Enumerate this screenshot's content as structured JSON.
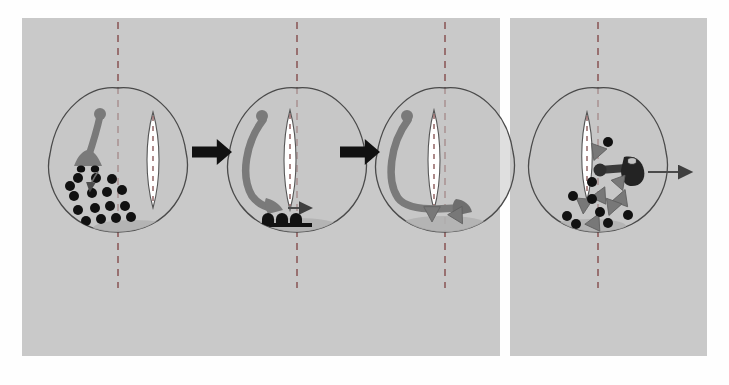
{
  "figure": {
    "background_color": "#ffffff",
    "panel_color": "#c9c9c9",
    "panel_left": {
      "label": "left-panel",
      "x": 22,
      "y": 18,
      "width": 478,
      "height": 338
    },
    "panel_right": {
      "label": "right-panel",
      "x": 510,
      "y": 18,
      "width": 197,
      "height": 338
    }
  },
  "colors": {
    "panel_bg": "#c9c9c9",
    "cell_fill": "#c4c4c4",
    "cell_outline": "#4a4a4a",
    "nucleus_fill": "#ffffff",
    "nucleus_outline": "#555555",
    "axis_dash": "#8c5a5a",
    "organelle": "#7a7a7a",
    "granule": "#111111",
    "triangle": "#787878",
    "shadow": "#b0b0b0",
    "block_arrow": "#111111",
    "thin_arrow": "#555555"
  },
  "stages": [
    {
      "id": "stage-1",
      "name": "cell-stage-1",
      "cx": 118,
      "cy": 170,
      "axis_dash": true,
      "spindle": {
        "present": true,
        "x": 145,
        "y": 112,
        "w": 16,
        "h": 96,
        "orientation": "vertical"
      },
      "stalk": {
        "present": true,
        "shape": "diagonal-stalk-with-knob",
        "description": "organelle stalk running from upper knob down-left to a flared foot"
      },
      "knob": {
        "present": true,
        "x": 100,
        "y": 114,
        "r": 6
      },
      "foot": {
        "present": true,
        "x": 88,
        "y": 160,
        "type": "flared-foot-with-two-dark-ovals"
      },
      "granules": [
        {
          "x": 78,
          "y": 178,
          "r": 5
        },
        {
          "x": 96,
          "y": 178,
          "r": 5
        },
        {
          "x": 112,
          "y": 179,
          "r": 5
        },
        {
          "x": 74,
          "y": 196,
          "r": 5
        },
        {
          "x": 92,
          "y": 193,
          "r": 5
        },
        {
          "x": 107,
          "y": 192,
          "r": 5
        },
        {
          "x": 122,
          "y": 190,
          "r": 5
        },
        {
          "x": 78,
          "y": 210,
          "r": 5
        },
        {
          "x": 95,
          "y": 208,
          "r": 5
        },
        {
          "x": 110,
          "y": 206,
          "r": 5
        },
        {
          "x": 125,
          "y": 206,
          "r": 5
        },
        {
          "x": 86,
          "y": 221,
          "r": 5
        },
        {
          "x": 101,
          "y": 219,
          "r": 5
        },
        {
          "x": 116,
          "y": 218,
          "r": 5
        },
        {
          "x": 131,
          "y": 217,
          "r": 5
        },
        {
          "x": 70,
          "y": 186,
          "r": 5
        }
      ],
      "triangles": [],
      "internal_arrow": {
        "present": true,
        "x1": 98,
        "y1": 172,
        "x2": 90,
        "y2": 190,
        "style": "thin-curved"
      },
      "shadow": {
        "present": true,
        "cx": 133,
        "cy": 228,
        "rx": 40,
        "ry": 8
      },
      "exit_arrow": {
        "present": false
      }
    },
    {
      "id": "stage-2",
      "name": "cell-stage-2",
      "cx": 297,
      "cy": 170,
      "axis_dash": true,
      "spindle": {
        "present": true,
        "x": 282,
        "y": 110,
        "w": 16,
        "h": 100,
        "orientation": "vertical"
      },
      "stalk": {
        "present": true,
        "shape": "hooked-stalk-to-base",
        "description": "organelle stalk curving from upper knob around left side to a flared foot at the cell base"
      },
      "knob": {
        "present": true,
        "x": 262,
        "y": 116,
        "r": 6
      },
      "foot": {
        "present": true,
        "x": 275,
        "y": 207,
        "type": "flared-foot"
      },
      "granules": [],
      "docked_granules": {
        "present": true,
        "count": 3,
        "x": 276,
        "y": 222,
        "description": "dark docked vesicles fused at the contact zone"
      },
      "triangles": [],
      "internal_arrow": {
        "present": true,
        "x1": 288,
        "y1": 208,
        "x2": 310,
        "y2": 208,
        "style": "straight-right"
      },
      "shadow": {
        "present": true,
        "cx": 296,
        "cy": 226,
        "rx": 42,
        "ry": 8
      },
      "exit_arrow": {
        "present": false
      }
    },
    {
      "id": "stage-3",
      "name": "cell-stage-3",
      "cx": 445,
      "cy": 170,
      "axis_dash": true,
      "spindle": {
        "present": true,
        "x": 426,
        "y": 110,
        "w": 16,
        "h": 100,
        "orientation": "vertical"
      },
      "stalk": {
        "present": true,
        "shape": "hooked-stalk-along-base",
        "description": "organelle stalk curving down the left side then running horizontally along the cell base to a flared head on the right"
      },
      "knob": {
        "present": true,
        "x": 407,
        "y": 116,
        "r": 6
      },
      "foot": {
        "present": true,
        "x": 462,
        "y": 205,
        "type": "flared-head-right"
      },
      "granules": [],
      "triangles": [
        {
          "x": 432,
          "y": 213,
          "rot": 180,
          "size": 9
        },
        {
          "x": 458,
          "y": 216,
          "rot": 150,
          "size": 9
        }
      ],
      "internal_arrow": {
        "present": false
      },
      "shadow": {
        "present": true,
        "cx": 444,
        "cy": 224,
        "rx": 42,
        "ry": 8
      },
      "exit_arrow": {
        "present": false
      }
    },
    {
      "id": "stage-4",
      "name": "cell-stage-4",
      "cx": 598,
      "cy": 170,
      "axis_dash": true,
      "spindle": {
        "present": true,
        "x": 580,
        "y": 112,
        "w": 14,
        "h": 88,
        "orientation": "vertical"
      },
      "stalk": {
        "present": true,
        "shape": "horizontal-stalk-right",
        "description": "organelle stalk lying horizontally pointing right toward the cell edge"
      },
      "knob": {
        "present": true,
        "x": 600,
        "y": 170,
        "r": 6
      },
      "foot": {
        "present": true,
        "x": 629,
        "y": 168,
        "type": "flared-head-right-with-pore"
      },
      "granules": [
        {
          "x": 608,
          "y": 142,
          "r": 5
        },
        {
          "x": 592,
          "y": 182,
          "r": 5
        },
        {
          "x": 573,
          "y": 196,
          "r": 5
        },
        {
          "x": 592,
          "y": 199,
          "r": 5
        },
        {
          "x": 600,
          "y": 212,
          "r": 5
        },
        {
          "x": 567,
          "y": 216,
          "r": 5
        },
        {
          "x": 576,
          "y": 224,
          "r": 5
        },
        {
          "x": 608,
          "y": 223,
          "r": 5
        },
        {
          "x": 628,
          "y": 215,
          "r": 5
        }
      ],
      "triangles": [
        {
          "x": 597,
          "y": 152,
          "rot": 200,
          "size": 9
        },
        {
          "x": 620,
          "y": 183,
          "rot": 160,
          "size": 8
        },
        {
          "x": 601,
          "y": 195,
          "rot": 25,
          "size": 9
        },
        {
          "x": 622,
          "y": 198,
          "rot": 20,
          "size": 9
        },
        {
          "x": 584,
          "y": 205,
          "rot": 185,
          "size": 9
        },
        {
          "x": 612,
          "y": 207,
          "rot": 200,
          "size": 9
        },
        {
          "x": 595,
          "y": 222,
          "rot": 25,
          "size": 9
        }
      ],
      "internal_arrow": {
        "present": false
      },
      "shadow": {
        "present": true,
        "cx": 590,
        "cy": 226,
        "rx": 36,
        "ry": 7
      },
      "exit_arrow": {
        "present": true,
        "x1": 648,
        "y1": 172,
        "x2": 690,
        "y2": 172,
        "style": "thin-right"
      }
    }
  ],
  "flow_arrows": [
    {
      "id": "flow-1",
      "name": "stage-1-to-2",
      "x": 192,
      "y": 139,
      "width": 40,
      "height": 26,
      "direction": "right"
    },
    {
      "id": "flow-2",
      "name": "stage-2-to-3",
      "x": 340,
      "y": 139,
      "width": 40,
      "height": 26,
      "direction": "right"
    }
  ]
}
